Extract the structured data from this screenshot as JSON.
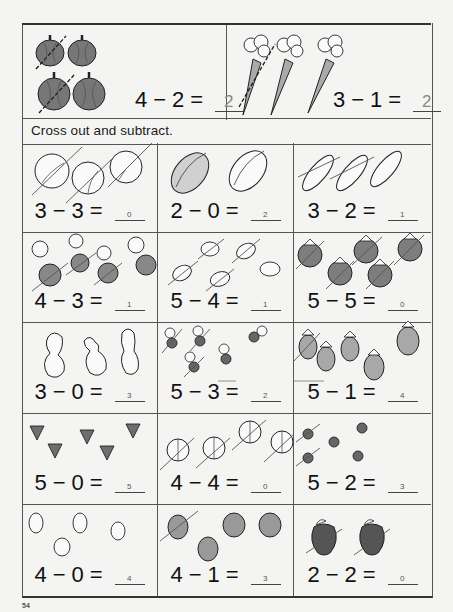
{
  "worksheet": {
    "examples": [
      {
        "item": "pumpkin",
        "total": 4,
        "crossed": 2,
        "equation": {
          "a": "4",
          "op": "−",
          "b": "2",
          "eq": "=",
          "answer": "2"
        }
      },
      {
        "item": "carrot",
        "total": 3,
        "crossed": 1,
        "equation": {
          "a": "3",
          "op": "−",
          "b": "1",
          "eq": "=",
          "answer": "2"
        }
      }
    ],
    "instruction": "Cross out and subtract.",
    "problems": [
      {
        "item": "lettuce",
        "total": 3,
        "crossed": 3,
        "equation": {
          "a": "3",
          "op": "−",
          "b": "3",
          "eq": "=",
          "answer": "0"
        }
      },
      {
        "item": "melon",
        "total": 2,
        "crossed": 0,
        "equation": {
          "a": "2",
          "op": "−",
          "b": "0",
          "eq": "=",
          "answer": "2"
        }
      },
      {
        "item": "cucumber",
        "total": 3,
        "crossed": 2,
        "equation": {
          "a": "3",
          "op": "−",
          "b": "2",
          "eq": "=",
          "answer": "1"
        }
      },
      {
        "item": "radish",
        "total": 4,
        "crossed": 3,
        "equation": {
          "a": "4",
          "op": "−",
          "b": "3",
          "eq": "=",
          "answer": "1"
        }
      },
      {
        "item": "potato",
        "total": 5,
        "crossed": 4,
        "equation": {
          "a": "5",
          "op": "−",
          "b": "4",
          "eq": "=",
          "answer": "1"
        }
      },
      {
        "item": "tomato",
        "total": 5,
        "crossed": 5,
        "equation": {
          "a": "5",
          "op": "−",
          "b": "5",
          "eq": "=",
          "answer": "0"
        }
      },
      {
        "item": "gourd",
        "total": 3,
        "crossed": 0,
        "equation": {
          "a": "3",
          "op": "−",
          "b": "0",
          "eq": "=",
          "answer": "3"
        }
      },
      {
        "item": "beet",
        "total": 5,
        "crossed": 3,
        "equation": {
          "a": "5",
          "op": "−",
          "b": "3",
          "eq": "=",
          "answer": "2"
        }
      },
      {
        "item": "eggplant",
        "total": 5,
        "crossed": 1,
        "equation": {
          "a": "5",
          "op": "−",
          "b": "1",
          "eq": "=",
          "answer": "4"
        }
      },
      {
        "item": "strawberry",
        "total": 5,
        "crossed": 0,
        "equation": {
          "a": "5",
          "op": "−",
          "b": "0",
          "eq": "=",
          "answer": "5"
        }
      },
      {
        "item": "onion",
        "total": 4,
        "crossed": 4,
        "equation": {
          "a": "4",
          "op": "−",
          "b": "4",
          "eq": "=",
          "answer": "0"
        }
      },
      {
        "item": "cherry",
        "total": 5,
        "crossed": 2,
        "equation": {
          "a": "5",
          "op": "−",
          "b": "2",
          "eq": "=",
          "answer": "3"
        }
      },
      {
        "item": "pear",
        "total": 4,
        "crossed": 0,
        "equation": {
          "a": "4",
          "op": "−",
          "b": "0",
          "eq": "=",
          "answer": "4"
        }
      },
      {
        "item": "peach",
        "total": 4,
        "crossed": 1,
        "equation": {
          "a": "4",
          "op": "−",
          "b": "1",
          "eq": "=",
          "answer": "3"
        }
      },
      {
        "item": "apple",
        "total": 2,
        "crossed": 2,
        "equation": {
          "a": "2",
          "op": "−",
          "b": "2",
          "eq": "=",
          "answer": "0"
        }
      }
    ],
    "page_number": "54"
  },
  "colors": {
    "background": "#f4f4f2",
    "line": "#555555",
    "ink": "#111111",
    "fill_gray": "#8a8a8a",
    "fill_light": "#bdbdbd",
    "answer_ink": "#888888"
  }
}
